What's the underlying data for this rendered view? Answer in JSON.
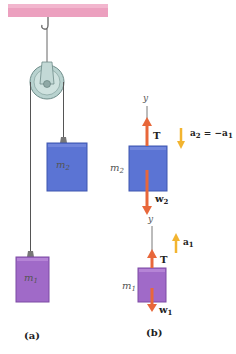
{
  "figure": {
    "panel_a": {
      "label": "(a)",
      "mass_top": {
        "symbol": "m",
        "sub": "2",
        "color": "#5b74d4"
      },
      "mass_bottom": {
        "symbol": "m",
        "sub": "1",
        "color": "#a06ac8"
      },
      "ceiling_color": "#e98fb4",
      "pulley_color": "#a9c8c4"
    },
    "panel_b": {
      "label": "(b)",
      "fbd_m2": {
        "axis": "y",
        "mass": {
          "symbol": "m",
          "sub": "2"
        },
        "tension": "T",
        "weight": {
          "symbol": "w",
          "sub": "2"
        },
        "accel": {
          "text_a": "a",
          "sub_a": "2",
          "eq": " = −a",
          "sub_b": "1"
        }
      },
      "fbd_m1": {
        "axis": "y",
        "mass": {
          "symbol": "m",
          "sub": "1"
        },
        "tension": "T",
        "weight": {
          "symbol": "w",
          "sub": "1"
        },
        "accel": {
          "text_a": "a",
          "sub_a": "1"
        }
      }
    },
    "colors": {
      "force_arrow": "#e8673a",
      "accel_arrow": "#f2b430",
      "rope": "#555555"
    }
  }
}
